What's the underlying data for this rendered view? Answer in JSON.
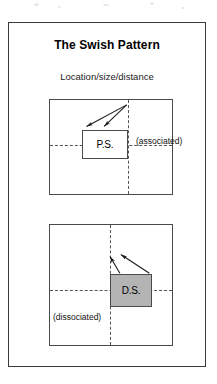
{
  "figure": {
    "title": "The Swish Pattern",
    "subtitle": "Location/size/distance"
  },
  "panels": {
    "associated": {
      "name": "associated",
      "label": "(associated)",
      "box_label": "P.S.",
      "box_fill": "#ffffff",
      "arrow_count": 2,
      "arrow_direction": "down-left"
    },
    "dissociated": {
      "name": "dissociated",
      "label": "(dissociated)",
      "box_label": "D.S.",
      "box_fill": "#b4b4b4",
      "arrow_count": 2,
      "arrow_direction": "up-left"
    }
  },
  "colors": {
    "frame_border": "#3a3a3a",
    "panel_border": "#4a4a4a",
    "dashed_axis": "#555555",
    "arrow_stroke": "#1a1a1a",
    "page_background": "#ffffff"
  }
}
